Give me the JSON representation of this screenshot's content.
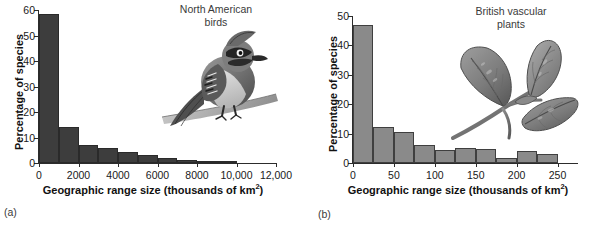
{
  "figure": {
    "panels": [
      {
        "letter": "(a)",
        "group_title": "North American\nbirds",
        "illustration": "blue-jay-bird-illustration",
        "chart": {
          "type": "bar",
          "title": "North American birds",
          "xlabel": "Geographic range size (thousands of km",
          "xlabel_sup": "2",
          "xlabel_tail": ")",
          "ylabel": "Percentage of species",
          "xlim": [
            0,
            12000
          ],
          "ylim": [
            0,
            60
          ],
          "xticks": [
            0,
            2000,
            4000,
            6000,
            8000,
            10000,
            12000
          ],
          "xtick_labels": [
            "0",
            "2000",
            "4000",
            "6000",
            "8000",
            "10,000",
            "12,000"
          ],
          "yticks": [
            0,
            10,
            20,
            30,
            40,
            50,
            60
          ],
          "ytick_labels": [
            "0",
            "10",
            "20",
            "30",
            "40",
            "50",
            "60"
          ],
          "bin_width": 1000,
          "bar_color": "#3d3d3d",
          "grid": false,
          "legend": "none",
          "bin_starts": [
            0,
            1000,
            2000,
            3000,
            4000,
            5000,
            6000,
            7000,
            8000,
            9000
          ],
          "values": [
            58.5,
            14.3,
            7.0,
            5.7,
            4.4,
            3.0,
            1.9,
            1.2,
            0.9,
            0.3
          ]
        }
      },
      {
        "letter": "(b)",
        "group_title": "British vascular\nplants",
        "illustration": "three-leaf-plant-illustration",
        "chart": {
          "type": "bar",
          "title": "British vascular plants",
          "xlabel": "Geographic range size (thousands of km",
          "xlabel_sup": "2",
          "xlabel_tail": ")",
          "ylabel": "Percentage of species",
          "xlim": [
            0,
            275
          ],
          "ylim": [
            0,
            50
          ],
          "xticks": [
            0,
            50,
            100,
            150,
            200,
            250
          ],
          "xtick_labels": [
            "0",
            "50",
            "100",
            "150",
            "200",
            "250"
          ],
          "yticks": [
            0,
            10,
            20,
            30,
            40,
            50
          ],
          "ytick_labels": [
            "0",
            "10",
            "20",
            "30",
            "40",
            "50"
          ],
          "bin_width": 25,
          "bar_color": "#8a8a8a",
          "bar_edge_color": "#3f3f3f",
          "grid": false,
          "legend": "none",
          "bin_starts": [
            0,
            25,
            50,
            75,
            100,
            125,
            150,
            175,
            200,
            225
          ],
          "values": [
            46.8,
            12.3,
            10.7,
            6.0,
            4.4,
            5.0,
            4.6,
            1.7,
            4.0,
            3.2
          ]
        }
      }
    ]
  },
  "chart_data": [
    {
      "type": "bar",
      "title": "North American birds",
      "xlabel": "Geographic range size (thousands of km2)",
      "ylabel": "Percentage of species",
      "xlim": [
        0,
        12000
      ],
      "ylim": [
        0,
        60
      ],
      "grid": false,
      "legend": "none",
      "categories": [
        "0-1000",
        "1000-2000",
        "2000-3000",
        "3000-4000",
        "4000-5000",
        "5000-6000",
        "6000-7000",
        "7000-8000",
        "8000-9000",
        "9000-10000"
      ],
      "values": [
        58.5,
        14.3,
        7.0,
        5.7,
        4.4,
        3.0,
        1.9,
        1.2,
        0.9,
        0.3
      ]
    },
    {
      "type": "bar",
      "title": "British vascular plants",
      "xlabel": "Geographic range size (thousands of km2)",
      "ylabel": "Percentage of species",
      "xlim": [
        0,
        275
      ],
      "ylim": [
        0,
        50
      ],
      "grid": false,
      "legend": "none",
      "categories": [
        "0-25",
        "25-50",
        "50-75",
        "75-100",
        "100-125",
        "125-150",
        "150-175",
        "175-200",
        "200-225",
        "225-250"
      ],
      "values": [
        46.8,
        12.3,
        10.7,
        6.0,
        4.4,
        5.0,
        4.6,
        1.7,
        4.0,
        3.2
      ]
    }
  ]
}
